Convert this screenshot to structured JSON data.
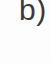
{
  "figure": {
    "panel": {
      "label": "b)",
      "label_color": "#3a3a3a",
      "background_color": "#fdfdfd"
    },
    "content": {
      "note": ""
    }
  }
}
